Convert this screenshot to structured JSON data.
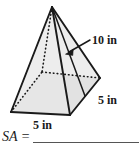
{
  "figure": {
    "shape_name": "square-pyramid",
    "fill_color": "#e6e6e6",
    "stroke_color": "#1a1a1a",
    "hidden_edge_style": "dotted",
    "labels": {
      "slant_height": "10 in",
      "base_edge_right": "5 in",
      "base_edge_front": "5 in"
    },
    "annotation": {
      "arrow_name": "slant-height-arrow",
      "points_to": "slant height edge"
    }
  },
  "answer": {
    "prompt": "SA =",
    "value": ""
  }
}
